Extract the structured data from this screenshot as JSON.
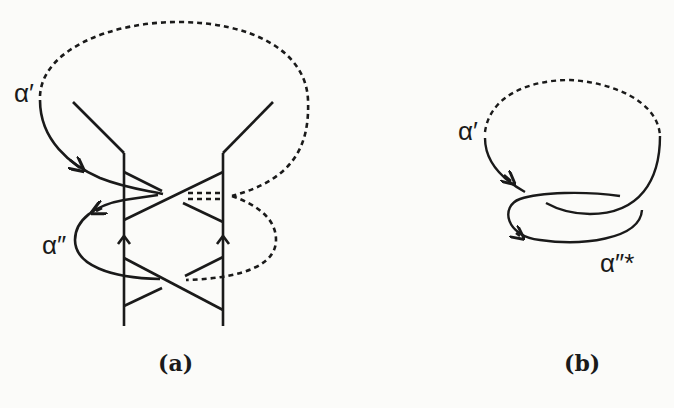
{
  "figure": {
    "panels": [
      {
        "id": "a",
        "caption": "(a)",
        "labels": {
          "alpha_prime": "α′",
          "alpha_double_prime": "α″"
        },
        "description": "Braid-like strand diagram with two vertical strands, crossing diagonals, upward arrows and a dashed closing loop"
      },
      {
        "id": "b",
        "caption": "(b)",
        "labels": {
          "alpha_prime": "α′",
          "alpha_double_prime_star": "α″*"
        },
        "description": "Simplified closed curve with an overlapping loop and a dashed arc"
      }
    ],
    "colors": {
      "ink": "#1a1a1a",
      "paper": "#fbfbf9",
      "bleed_text": "#e6e6e2"
    }
  }
}
